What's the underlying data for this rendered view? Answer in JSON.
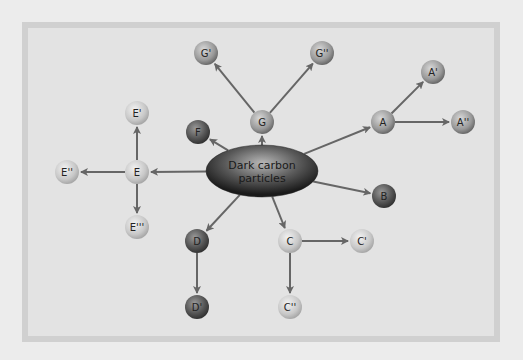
{
  "diagram": {
    "center": {
      "id": "center",
      "label_line1": "Dark carbon",
      "label_line2": "particles",
      "x": 262,
      "y": 171,
      "rx": 56,
      "ry": 26
    },
    "colors": {
      "background": "#ececec",
      "panel": "#e3e3e3",
      "panel_border": "#d0d0d0",
      "arrow": "#666666",
      "light": "#c8c8c8",
      "medium": "#999999",
      "dark": "#555555"
    },
    "nodes": [
      {
        "id": "E1",
        "label": "E'",
        "x": 137,
        "y": 113,
        "shade": "light"
      },
      {
        "id": "E",
        "label": "E",
        "x": 137,
        "y": 172,
        "shade": "light"
      },
      {
        "id": "E2",
        "label": "E''",
        "x": 67,
        "y": 172,
        "shade": "light"
      },
      {
        "id": "E3",
        "label": "E'''",
        "x": 137,
        "y": 227,
        "shade": "light"
      },
      {
        "id": "F",
        "label": "F",
        "x": 198,
        "y": 132,
        "shade": "dark"
      },
      {
        "id": "G",
        "label": "G",
        "x": 262,
        "y": 122,
        "shade": "medium"
      },
      {
        "id": "G1",
        "label": "G'",
        "x": 206,
        "y": 53,
        "shade": "medium"
      },
      {
        "id": "G2",
        "label": "G''",
        "x": 322,
        "y": 53,
        "shade": "medium"
      },
      {
        "id": "A",
        "label": "A",
        "x": 383,
        "y": 122,
        "shade": "medium"
      },
      {
        "id": "A1",
        "label": "A'",
        "x": 433,
        "y": 72,
        "shade": "medium"
      },
      {
        "id": "A2",
        "label": "A''",
        "x": 463,
        "y": 122,
        "shade": "medium"
      },
      {
        "id": "B",
        "label": "B",
        "x": 384,
        "y": 196,
        "shade": "dark"
      },
      {
        "id": "D",
        "label": "D",
        "x": 197,
        "y": 241,
        "shade": "dark"
      },
      {
        "id": "D1",
        "label": "D'",
        "x": 197,
        "y": 307,
        "shade": "dark"
      },
      {
        "id": "C",
        "label": "C",
        "x": 290,
        "y": 241,
        "shade": "light"
      },
      {
        "id": "C1",
        "label": "C'",
        "x": 362,
        "y": 241,
        "shade": "light"
      },
      {
        "id": "C2",
        "label": "C''",
        "x": 290,
        "y": 307,
        "shade": "light"
      }
    ],
    "edges": [
      {
        "from": "center",
        "to": "E"
      },
      {
        "from": "E",
        "to": "E1"
      },
      {
        "from": "E",
        "to": "E2"
      },
      {
        "from": "E",
        "to": "E3"
      },
      {
        "from": "center",
        "to": "F"
      },
      {
        "from": "center",
        "to": "G"
      },
      {
        "from": "G",
        "to": "G1"
      },
      {
        "from": "G",
        "to": "G2"
      },
      {
        "from": "center",
        "to": "A"
      },
      {
        "from": "A",
        "to": "A1"
      },
      {
        "from": "A",
        "to": "A2"
      },
      {
        "from": "center",
        "to": "B"
      },
      {
        "from": "center",
        "to": "D"
      },
      {
        "from": "D",
        "to": "D1"
      },
      {
        "from": "center",
        "to": "C"
      },
      {
        "from": "C",
        "to": "C1"
      },
      {
        "from": "C",
        "to": "C2"
      }
    ]
  }
}
